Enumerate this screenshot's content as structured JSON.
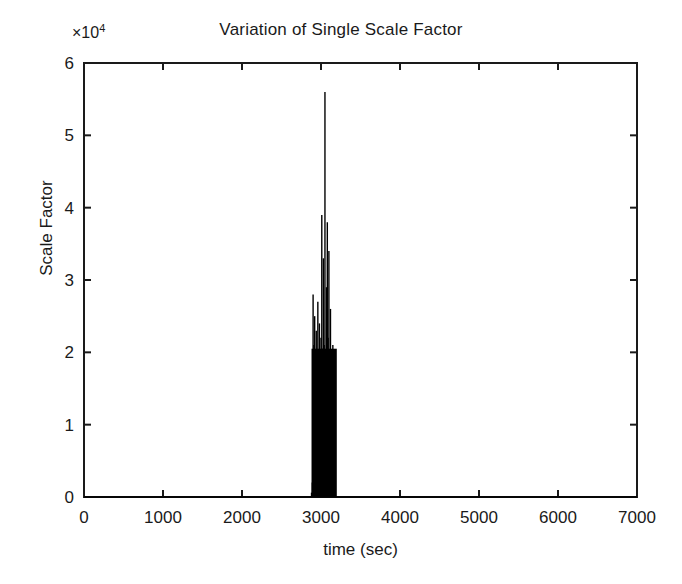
{
  "figure": {
    "background_color": "#ffffff",
    "line_color": "#000000",
    "data_color": "#000000"
  },
  "title": "Variation of Single Scale Factor",
  "exponent_prefix": "×10",
  "exponent_power": "4",
  "axes": {
    "xlabel": "time (sec)",
    "ylabel": "Scale Factor",
    "xticks": [
      "0",
      "1000",
      "2000",
      "3000",
      "4000",
      "5000",
      "6000",
      "7000"
    ],
    "yticks": [
      "0",
      "1",
      "2",
      "3",
      "4",
      "5",
      "6"
    ]
  },
  "chart_data": {
    "type": "line",
    "title": "Variation of Single Scale Factor",
    "xlabel": "time (sec)",
    "ylabel": "Scale Factor",
    "y_axis_exponent": 10000,
    "y_axis_exponent_label": "×10^4",
    "xlim": [
      0,
      7000
    ],
    "ylim": [
      0,
      60000
    ],
    "xticks": [
      0,
      1000,
      2000,
      3000,
      4000,
      5000,
      6000,
      7000
    ],
    "yticks": [
      0,
      10000,
      20000,
      30000,
      40000,
      50000,
      60000
    ],
    "ytick_labels_scaled": [
      0,
      1,
      2,
      3,
      4,
      5,
      6
    ],
    "grid": false,
    "legend": null,
    "series": [
      {
        "name": "Single Scale Factor",
        "color": "#000000",
        "description": "Scale factor is essentially zero across the whole record except for a dense burst of large spikes between roughly 2900 s and 3200 s, peaking at about 5.6e4.",
        "x": [
          0,
          500,
          1000,
          1500,
          2000,
          2400,
          2700,
          2850,
          2880,
          2890,
          2900,
          2905,
          2910,
          2915,
          2920,
          2925,
          2930,
          2935,
          2940,
          2945,
          2950,
          2955,
          2960,
          2965,
          2970,
          2975,
          2980,
          2985,
          2990,
          2995,
          3000,
          3005,
          3010,
          3015,
          3020,
          3025,
          3030,
          3035,
          3040,
          3045,
          3050,
          3055,
          3060,
          3065,
          3070,
          3075,
          3080,
          3085,
          3090,
          3095,
          3100,
          3105,
          3110,
          3115,
          3120,
          3125,
          3130,
          3135,
          3140,
          3145,
          3150,
          3155,
          3160,
          3170,
          3200,
          3400,
          3800,
          4200,
          4600,
          5000,
          5400,
          5800,
          6200,
          6600,
          7000
        ],
        "y": [
          0,
          0,
          0,
          0,
          0,
          0,
          0,
          0,
          600,
          2000,
          28000,
          4000,
          21000,
          3000,
          25000,
          5000,
          19000,
          2500,
          23000,
          4500,
          16000,
          3000,
          27000,
          6000,
          20000,
          3500,
          24000,
          5000,
          18000,
          2800,
          22000,
          4200,
          39000,
          6000,
          20500,
          3200,
          33000,
          5500,
          21000,
          3800,
          56000,
          7000,
          19000,
          3000,
          29000,
          4500,
          38000,
          6200,
          22000,
          3600,
          34000,
          5000,
          17500,
          2700,
          26000,
          4800,
          20000,
          3400,
          15000,
          2200,
          21000,
          3000,
          12000,
          4000,
          0,
          0,
          0,
          0,
          0,
          0,
          0,
          0,
          0,
          0,
          0
        ],
        "peak": {
          "x": 3050,
          "y": 56000
        },
        "burst_window": [
          2880,
          3200
        ],
        "baseline": 0
      }
    ],
    "notes": [
      "Baseline is flat at 0 for t < ~2880 s and t > ~3200 s.",
      "Dense vertical spike cluster between ~2880 s and ~3200 s fills solid black below ~2e4.",
      "Maximum spike reaches ~5.6e4 near t = 3050 s.",
      "Secondary spikes reach ~3.9e4, ~3.8e4, ~3.4e4 and ~3.3e4."
    ]
  }
}
